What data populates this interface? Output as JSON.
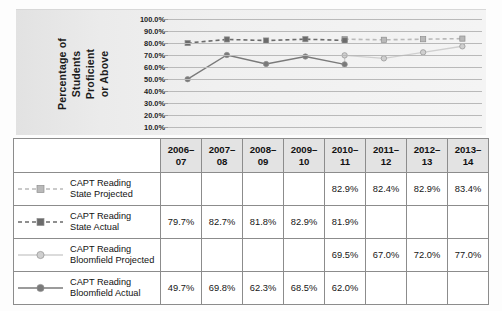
{
  "chart_data": {
    "type": "line",
    "title": "",
    "xlabel": "",
    "ylabel": "Percentage of Students Proficient or Above",
    "ylabel_lines": [
      "Percentage of",
      "Students",
      "Proficient",
      "or Above"
    ],
    "categories": [
      "2006–07",
      "2007–08",
      "2008–09",
      "2009–10",
      "2010–11",
      "2011–12",
      "2012–13",
      "2013–14"
    ],
    "ytick_labels": [
      "100.0%",
      "90.0%",
      "80.0%",
      "70.0%",
      "60.0%",
      "50.0%",
      "40.0%",
      "30.0%",
      "20.0%",
      "10.0%"
    ],
    "ytick_values": [
      100,
      90,
      80,
      70,
      60,
      50,
      40,
      30,
      20,
      10
    ],
    "ylim": [
      5,
      103
    ],
    "grid": true,
    "legend_position": "table-row-labels",
    "series": [
      {
        "name": "CAPT Reading State Projected",
        "name_lines": [
          "CAPT Reading",
          "State Projected"
        ],
        "style": "dashed",
        "marker": "square",
        "color": "#b9b9b9",
        "values": [
          null,
          null,
          null,
          null,
          82.9,
          82.4,
          82.9,
          83.4
        ],
        "value_labels": [
          "",
          "",
          "",
          "",
          "82.9%",
          "82.4%",
          "82.9%",
          "83.4%"
        ]
      },
      {
        "name": "CAPT Reading State Actual",
        "name_lines": [
          "CAPT Reading",
          "State Actual"
        ],
        "style": "dashed",
        "marker": "square",
        "color": "#6b6b6b",
        "values": [
          79.7,
          82.7,
          81.8,
          82.9,
          81.9,
          null,
          null,
          null
        ],
        "value_labels": [
          "79.7%",
          "82.7%",
          "81.8%",
          "82.9%",
          "81.9%",
          "",
          "",
          ""
        ]
      },
      {
        "name": "CAPT Reading Bloomfield Projected",
        "name_lines": [
          "CAPT Reading",
          "Bloomfield Projected"
        ],
        "style": "solid",
        "marker": "circle",
        "color": "#cfcfcf",
        "values": [
          null,
          null,
          null,
          null,
          69.5,
          67.0,
          72.0,
          77.0
        ],
        "value_labels": [
          "",
          "",
          "",
          "",
          "69.5%",
          "67.0%",
          "72.0%",
          "77.0%"
        ]
      },
      {
        "name": "CAPT Reading Bloomfield Actual",
        "name_lines": [
          "CAPT Reading",
          "Bloomfield Actual"
        ],
        "style": "solid",
        "marker": "circle",
        "color": "#7a7a7a",
        "values": [
          49.7,
          69.8,
          62.3,
          68.5,
          62.0,
          null,
          null,
          null
        ],
        "value_labels": [
          "49.7%",
          "69.8%",
          "62.3%",
          "68.5%",
          "62.0%",
          "",
          "",
          ""
        ]
      }
    ]
  },
  "table": {
    "corner_label": "",
    "headers": [
      "2006–07",
      "2007–08",
      "2008–09",
      "2009–10",
      "2010–11",
      "2011–12",
      "2012–13",
      "2013–14"
    ],
    "rows": [
      {
        "label_line1": "CAPT Reading",
        "label_line2": "State Projected",
        "cells": [
          "",
          "",
          "",
          "",
          "82.9%",
          "82.4%",
          "82.9%",
          "83.4%"
        ]
      },
      {
        "label_line1": "CAPT Reading",
        "label_line2": "State Actual",
        "cells": [
          "79.7%",
          "82.7%",
          "81.8%",
          "82.9%",
          "81.9%",
          "",
          "",
          ""
        ]
      },
      {
        "label_line1": "CAPT Reading",
        "label_line2": "Bloomfield Projected",
        "cells": [
          "",
          "",
          "",
          "",
          "69.5%",
          "67.0%",
          "72.0%",
          "77.0%"
        ]
      },
      {
        "label_line1": "CAPT Reading",
        "label_line2": "Bloomfield Actual",
        "cells": [
          "49.7%",
          "69.8%",
          "62.3%",
          "68.5%",
          "62.0%",
          "",
          "",
          ""
        ]
      }
    ]
  },
  "colors": {
    "grid": "#b9b9b9",
    "panel_bg": "#eeeeee",
    "header_bg": "#e3e3e3",
    "border": "#8c8c8c",
    "state_projected": "#b9b9b9",
    "state_actual": "#6b6b6b",
    "bloomfield_projected": "#cfcfcf",
    "bloomfield_actual": "#7a7a7a"
  }
}
